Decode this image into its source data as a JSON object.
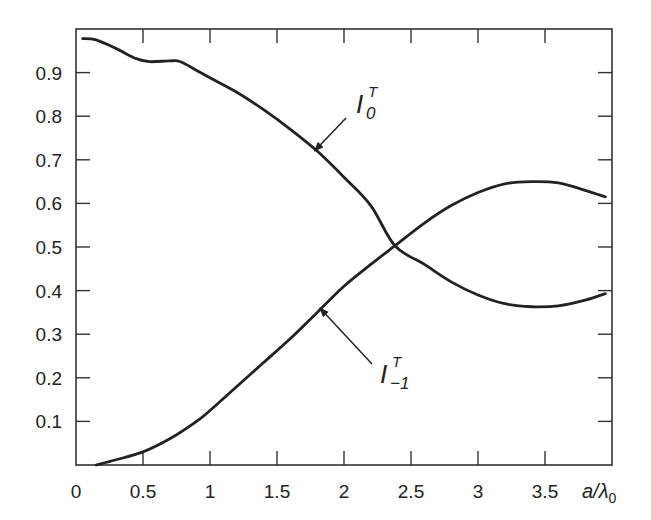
{
  "chart_data": {
    "type": "line",
    "title": "",
    "xlabel": "a/λ0",
    "ylabel": "",
    "xlim": [
      0,
      4
    ],
    "ylim": [
      0,
      1
    ],
    "grid": false,
    "legend": "inline annotations with arrows",
    "x_ticks": [
      0,
      0.5,
      1,
      1.5,
      2,
      2.5,
      3,
      3.5
    ],
    "x_tick_labels": [
      "0",
      "0.5",
      "1",
      "1.5",
      "2",
      "2.5",
      "3",
      "3.5"
    ],
    "y_ticks": [
      0.1,
      0.2,
      0.3,
      0.4,
      0.5,
      0.6,
      0.7,
      0.8,
      0.9
    ],
    "y_tick_labels": [
      "0.1",
      "0.2",
      "0.3",
      "0.4",
      "0.5",
      "0.6",
      "0.7",
      "0.8",
      "0.9"
    ],
    "series": [
      {
        "name": "I_0^T",
        "label_main": "I",
        "label_sup": "T",
        "label_sub": "0",
        "x": [
          0.05,
          0.15,
          0.3,
          0.45,
          0.55,
          0.7,
          0.78,
          0.9,
          1.0,
          1.2,
          1.4,
          1.6,
          1.8,
          2.0,
          2.2,
          2.38,
          2.6,
          2.8,
          3.0,
          3.2,
          3.4,
          3.6,
          3.8,
          3.95
        ],
        "values": [
          0.978,
          0.975,
          0.955,
          0.932,
          0.925,
          0.927,
          0.925,
          0.905,
          0.888,
          0.855,
          0.815,
          0.77,
          0.72,
          0.66,
          0.595,
          0.503,
          0.46,
          0.42,
          0.39,
          0.37,
          0.363,
          0.365,
          0.378,
          0.393
        ]
      },
      {
        "name": "I_-1^T",
        "label_main": "I",
        "label_sup": "T",
        "label_sub": "−1",
        "x": [
          0.15,
          0.3,
          0.5,
          0.7,
          0.9,
          1.0,
          1.2,
          1.4,
          1.6,
          1.8,
          2.0,
          2.2,
          2.38,
          2.6,
          2.8,
          3.0,
          3.2,
          3.4,
          3.6,
          3.8,
          3.95
        ],
        "values": [
          0.0,
          0.012,
          0.03,
          0.06,
          0.1,
          0.125,
          0.18,
          0.235,
          0.29,
          0.35,
          0.41,
          0.46,
          0.503,
          0.555,
          0.595,
          0.625,
          0.645,
          0.65,
          0.647,
          0.63,
          0.615
        ]
      }
    ],
    "annotations": [
      {
        "series": 0,
        "text": "I_0^T",
        "arrow_to": [
          1.78,
          0.72
        ]
      },
      {
        "series": 1,
        "text": "I_-1^T",
        "arrow_to": [
          1.82,
          0.36
        ]
      }
    ]
  }
}
